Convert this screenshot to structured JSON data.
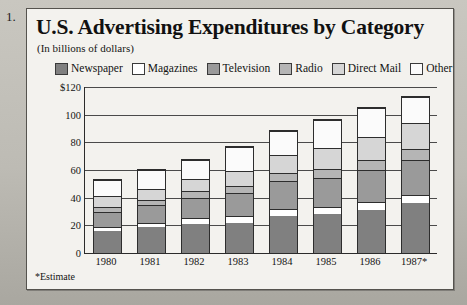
{
  "list_marker": "1.",
  "figure": {
    "title": "U.S. Advertising Expenditures by Category",
    "subtitle": "(In billions of dollars)",
    "footnote": "*Estimate"
  },
  "chart_data": {
    "type": "bar",
    "subtype": "stacked-bar",
    "title": "U.S. Advertising Expenditures by Category",
    "subtitle": "(In billions of dollars)",
    "xlabel": "",
    "ylabel": "$ billions",
    "ylim": [
      0,
      120
    ],
    "yticks": [
      0,
      20,
      40,
      60,
      80,
      100,
      120
    ],
    "ytick_labels": [
      "0",
      "20",
      "40",
      "60",
      "80",
      "100",
      "$120"
    ],
    "grid": true,
    "legend_position": "top",
    "categories": [
      "1980",
      "1981",
      "1982",
      "1983",
      "1984",
      "1985",
      "1986",
      "1987*"
    ],
    "series": [
      {
        "name": "Newspaper",
        "color": "#808080",
        "values": [
          16,
          18.5,
          21,
          22,
          27,
          28,
          31,
          36
        ]
      },
      {
        "name": "Magazines",
        "color": "#ffffff",
        "values": [
          3,
          3.5,
          4,
          4.5,
          5,
          5.5,
          6,
          6
        ]
      },
      {
        "name": "Television",
        "color": "#9a9a9a",
        "values": [
          11,
          12.5,
          15,
          17,
          20,
          21,
          23,
          25
        ]
      },
      {
        "name": "Radio",
        "color": "#b5b5b5",
        "values": [
          3.5,
          4,
          4.5,
          5,
          6,
          6.5,
          7,
          8
        ]
      },
      {
        "name": "Direct Mail",
        "color": "#d6d6d6",
        "values": [
          7.5,
          8,
          9,
          11,
          13,
          15,
          17,
          19
        ]
      },
      {
        "name": "Other",
        "color": "#fbfbfb",
        "values": [
          12,
          13.5,
          13.5,
          17,
          17,
          20,
          21,
          19
        ]
      }
    ],
    "totals": [
      53,
      60,
      67,
      76.5,
      88,
      96,
      105,
      113
    ],
    "annotations": [
      "*Estimate"
    ]
  },
  "legend": {
    "items": [
      {
        "label": "Newspaper",
        "icon": "legend-swatch-newspaper",
        "color": "#808080"
      },
      {
        "label": "Magazines",
        "icon": "legend-swatch-magazines",
        "color": "#ffffff"
      },
      {
        "label": "Television",
        "icon": "legend-swatch-television",
        "color": "#9a9a9a"
      },
      {
        "label": "Radio",
        "icon": "legend-swatch-radio",
        "color": "#b5b5b5"
      },
      {
        "label": "Direct Mail",
        "icon": "legend-swatch-direct-mail",
        "color": "#d6d6d6"
      },
      {
        "label": "Other",
        "icon": "legend-swatch-other",
        "color": "#fbfbfb"
      }
    ]
  }
}
